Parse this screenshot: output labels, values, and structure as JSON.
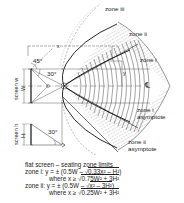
{
  "diagram": {
    "title": "flat screen – seating zone limits",
    "labels": {
      "zone_iii": "zone iii",
      "zone_ii": "zone ii",
      "zone_i": "zone i",
      "zone_i_asymptote_1": "zone i",
      "zone_i_asymptote_2": "asymptote",
      "zone_ii_asymptote_1": "zone ii",
      "zone_ii_asymptote_2": "asymptote",
      "x": "x",
      "y": "y",
      "centerline": "℄",
      "angle_45": "45°",
      "angle_30_top": "30°",
      "angle_30_bottom": "30°",
      "screen_w": "screen w",
      "W": "W",
      "screen_h": "screen h",
      "H": "H"
    },
    "formulas": {
      "heading": "flat screen – seating zone limits",
      "zone_i_label": "zone i:",
      "zone_i_eq_pre": "y = ± (0.5W – ",
      "zone_i_eq_rad": "0.33x² – H²",
      "zone_i_eq_post": ")",
      "zone_i_where_pre": "where x ≥ ",
      "zone_i_where_rad": "0.75W² + 3H²",
      "zone_ii_label": "zone ii:",
      "zone_ii_eq_pre": "y = ± (0.5W – ",
      "zone_ii_eq_rad": "x² – 3H²",
      "zone_ii_eq_post": ")",
      "zone_ii_where_pre": "where x ≥ ",
      "zone_ii_where_rad": "0.25W² + 3H²",
      "sqrt": "√"
    },
    "colors": {
      "line": "#222222",
      "hatch": "#555555",
      "background": "#ffffff"
    }
  }
}
